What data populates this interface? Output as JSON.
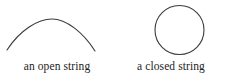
{
  "figure": {
    "background_color": "#ffffff",
    "stroke_color": "#3a3a3a",
    "text_color": "#1c1c1c",
    "panels": [
      {
        "id": "open-string",
        "shape": "arc",
        "caption": "an open string"
      },
      {
        "id": "closed-string",
        "shape": "circle",
        "caption": "a closed string"
      }
    ]
  }
}
